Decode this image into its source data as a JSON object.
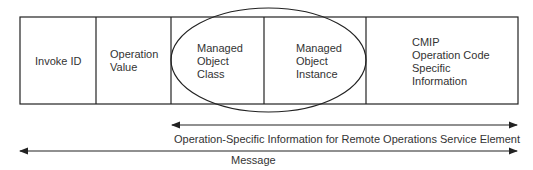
{
  "diagram": {
    "fields": [
      {
        "label": "Invoke ID"
      },
      {
        "label": "Operation\nValue"
      },
      {
        "label": "Managed\nObject\nClass"
      },
      {
        "label": "Managed\nObject\nInstance"
      },
      {
        "label": "CMIP\nOperation Code\nSpecific\nInformation"
      }
    ],
    "arrows": [
      {
        "label": "Operation-Specific Information for Remote Operations Service Element"
      },
      {
        "label": "Message"
      }
    ],
    "colors": {
      "stroke": "#222222",
      "text": "#333333",
      "background": "#ffffff"
    }
  }
}
